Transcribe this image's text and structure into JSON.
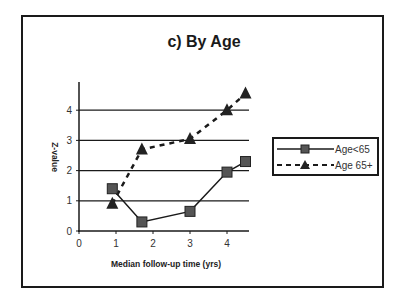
{
  "chart_data": {
    "type": "line",
    "title": "c) By Age",
    "xlabel": "Median follow-up time (yrs)",
    "ylabel": "Z-value",
    "xlim": [
      0,
      4.6
    ],
    "ylim": [
      0,
      4.8
    ],
    "x_ticks": [
      "0",
      "1",
      "2",
      "3",
      "4"
    ],
    "y_ticks": [
      "0",
      "1",
      "2",
      "3",
      "4"
    ],
    "grid": "horizontal",
    "legend_position": "right",
    "series": [
      {
        "name": "Age<65",
        "line_style": "solid",
        "marker": "square",
        "x": [
          0.9,
          1.7,
          3.0,
          4.0,
          4.5
        ],
        "values": [
          1.4,
          0.3,
          0.65,
          1.95,
          2.3
        ]
      },
      {
        "name": "Age 65+",
        "line_style": "dashed",
        "marker": "triangle",
        "x": [
          0.9,
          1.7,
          3.0,
          4.0,
          4.5
        ],
        "values": [
          0.9,
          2.7,
          3.05,
          4.0,
          4.55
        ]
      }
    ]
  },
  "colors": {
    "line": "#1a1a1a",
    "marker_fill": "#555555",
    "grid": "#1a1a1a"
  }
}
